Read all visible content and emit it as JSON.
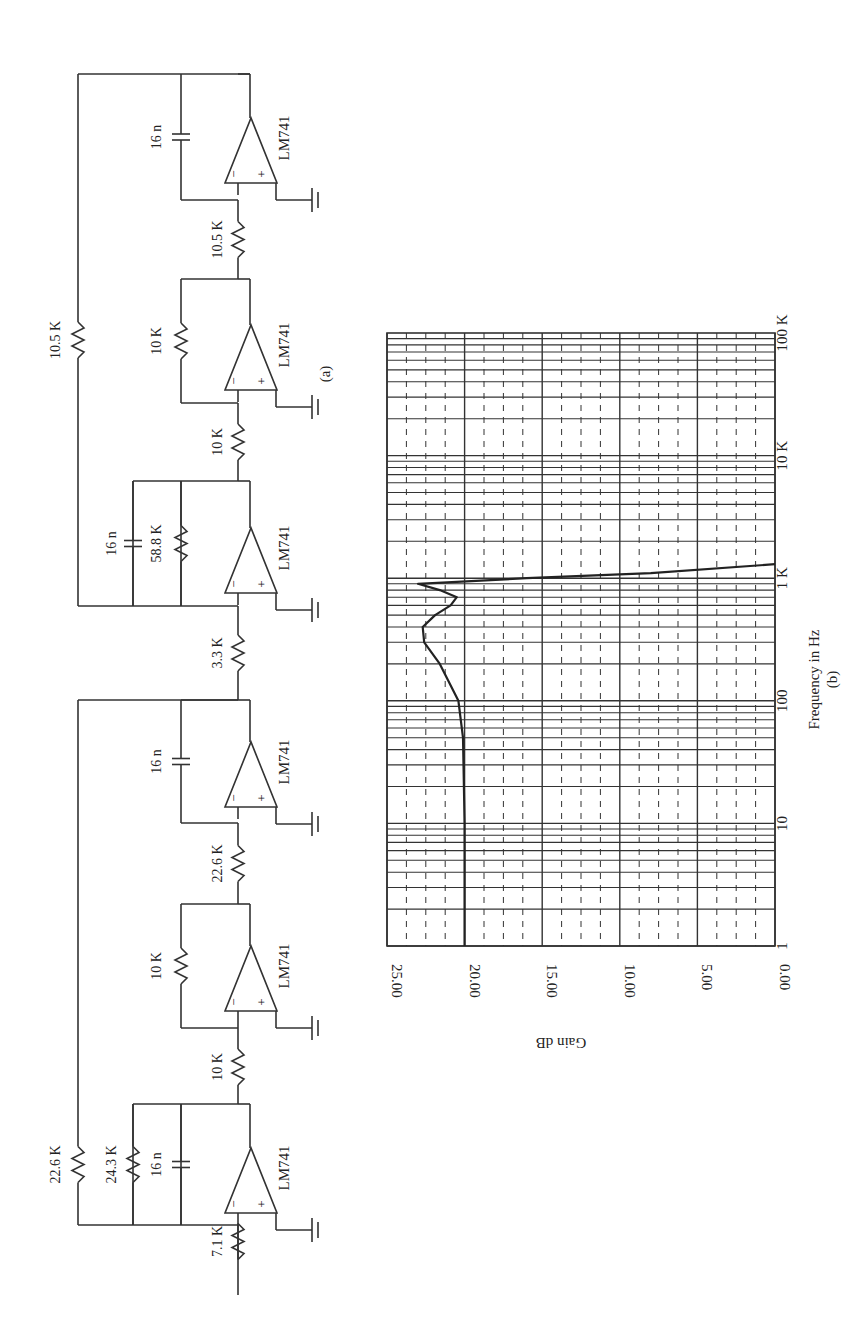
{
  "circuit": {
    "caption": "(a)",
    "opamp_label": "LM741",
    "stages": [
      {
        "input_resistor": "7.1 K",
        "feedback_resistor": "24.3 K",
        "feedback_capacitor": "16 n",
        "global_feedback_resistor": "22.6 K"
      },
      {
        "input_resistor": "10 K",
        "feedback_resistor": "10 K"
      },
      {
        "input_resistor": "22.6 K",
        "feedback_capacitor": "16 n"
      },
      {
        "input_resistor": "3.3 K",
        "feedback_resistor": "58.8 K",
        "feedback_capacitor": "16 n",
        "global_feedback_resistor": "10.5 K"
      },
      {
        "input_resistor": "10 K",
        "feedback_resistor": "10 K"
      },
      {
        "input_resistor": "10.5 K",
        "feedback_capacitor": "16 n"
      }
    ],
    "minus": "−",
    "plus": "+"
  },
  "chart_data": {
    "type": "line",
    "caption": "(b)",
    "xlabel": "Frequency in Hz",
    "ylabel": "Gain dB",
    "xscale": "log",
    "x_ticks": [
      "1",
      "10",
      "100",
      "1 K",
      "10 K",
      "100 K"
    ],
    "y_ticks": [
      "0.00",
      "5.00",
      "10.00",
      "15.00",
      "20.00",
      "25.00"
    ],
    "xlim": [
      1,
      100000
    ],
    "ylim": [
      0,
      25
    ],
    "grid": true,
    "series": [
      {
        "name": "Gain",
        "x": [
          1,
          10,
          50,
          100,
          200,
          300,
          400,
          500,
          600,
          700,
          800,
          900,
          1000,
          1100,
          1300
        ],
        "y": [
          20.0,
          20.0,
          20.1,
          20.4,
          21.6,
          22.6,
          22.7,
          21.9,
          20.9,
          20.5,
          21.6,
          23.0,
          16.0,
          8.0,
          0.0
        ]
      }
    ],
    "rotated": "90deg clockwise (page-rotated figure)"
  }
}
